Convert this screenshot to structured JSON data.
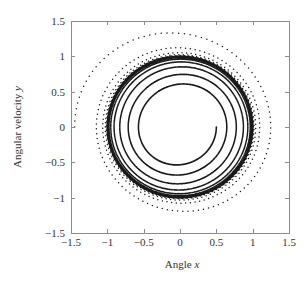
{
  "chart_data": {
    "type": "scatter",
    "title": "",
    "xlabel": "Angle x",
    "xlabel_text": "Angle ",
    "xlabel_var": "x",
    "ylabel": "Angular velocity y",
    "ylabel_text": "Angular velocity ",
    "ylabel_var": "y",
    "xlim": [
      -1.5,
      1.5
    ],
    "ylim": [
      -1.5,
      1.5
    ],
    "xticks": [
      -1.5,
      -1,
      -0.5,
      0,
      0.5,
      1,
      1.5
    ],
    "yticks": [
      -1.5,
      -1,
      -0.5,
      0,
      0.5,
      1,
      1.5
    ],
    "xtick_labels": [
      "−1.5",
      "−1",
      "−0.5",
      "0",
      "0.5",
      "1",
      "1.5"
    ],
    "ytick_labels": [
      "−1.5",
      "−1",
      "−0.5",
      "0",
      "0.5",
      "1",
      "1.5"
    ],
    "grid": false,
    "legend": null,
    "limit_cycle": {
      "center": [
        0,
        0
      ],
      "radius": 1.0
    },
    "series": [
      {
        "name": "inner trajectory",
        "start": [
          0.5,
          0
        ],
        "direction": "outward",
        "marker": "dot",
        "color": "#1a1a1a",
        "extent_points": {
          "start_x": 0.5,
          "approaches_radius": 1.0
        }
      },
      {
        "name": "outer trajectory",
        "start": [
          -1.45,
          0
        ],
        "direction": "inward",
        "marker": "dot",
        "color": "#1a1a1a",
        "extent_points": {
          "left_x": -1.45,
          "top_y": 1.39,
          "right_x": 1.27,
          "bottom_y": -1.24,
          "approaches_radius": 1.0
        }
      }
    ],
    "model": {
      "dx": "y",
      "dy": "-x + mu*(1 - x^2 - y^2)*y",
      "mu": 0.12
    }
  },
  "layout": {
    "plot_left": 71,
    "plot_top": 21,
    "plot_right": 289,
    "plot_bottom": 233
  },
  "colors": {
    "axis": "#8c8c8c",
    "trajectory": "#1a1a1a",
    "text": "#333333"
  }
}
